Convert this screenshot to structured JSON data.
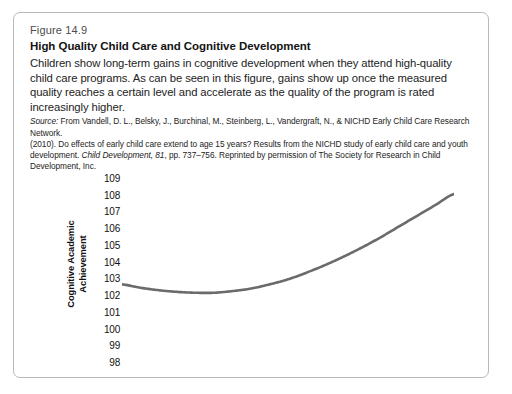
{
  "figure": {
    "number": "Figure 14.9",
    "title": "High Quality Child Care and Cognitive Development",
    "description": "Children show long-term gains in cognitive development when they attend high-quality child care programs. As can be seen in this figure, gains show up once the measured quality reaches a certain level and accelerate as the quality of the program is rated increasingly higher.",
    "source_label": "Source:",
    "source_line1": " From Vandell, D. L., Belsky, J., Burchinal, M., Steinberg, L., Vandergraft, N., & NICHD Early Child Care Research Network.",
    "source_line2": "(2010). Do effects of early child care extend to age 15 years? Results from the NICHD study of early child care and youth",
    "source_line3_a": "development. ",
    "source_line3_italic": "Child Development, 81",
    "source_line3_b": ", pp. 737–756. Reprinted by permission of The Society for Research in Child Development, Inc."
  },
  "colors": {
    "curve": "#6b6b6b",
    "border": "#b9b9b9",
    "text": "#1a1a1a",
    "fig_number": "#4c4c4c"
  },
  "chart_data": {
    "type": "line",
    "title": "High Quality Child Care and Cognitive Development",
    "xlabel": "Average Quality Score of Child Care Center",
    "ylabel": "Cognitive Academic Achievement",
    "xlim": [
      2,
      3.8
    ],
    "ylim": [
      98,
      109
    ],
    "grid": false,
    "legend": "none",
    "xticks": [
      "2",
      "2.1",
      "2.2",
      "2.3",
      "2.4",
      "2.5",
      "2.6",
      "2.7",
      "2.8",
      "2.9",
      "3",
      "3.1",
      "3.2",
      "3.3",
      "3.4",
      "3.5",
      "3.6",
      "3.7",
      "3.8"
    ],
    "yticks": [
      109,
      108,
      107,
      106,
      105,
      104,
      103,
      102,
      101,
      100,
      99,
      98
    ],
    "series": [
      {
        "name": "Cognitive Academic Achievement",
        "x": [
          2,
          2.1,
          2.2,
          2.3,
          2.4,
          2.5,
          2.6,
          2.7,
          2.8,
          2.9,
          3,
          3.1,
          3.2,
          3.3,
          3.4,
          3.5,
          3.6,
          3.7,
          3.8
        ],
        "values": [
          102.7,
          102.5,
          102.35,
          102.25,
          102.2,
          102.2,
          102.3,
          102.45,
          102.7,
          103.0,
          103.4,
          103.85,
          104.35,
          104.9,
          105.5,
          106.15,
          106.8,
          107.45,
          108.1
        ]
      }
    ]
  }
}
